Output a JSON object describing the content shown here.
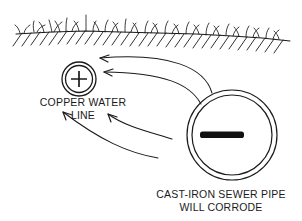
{
  "diagram": {
    "background_color": "#ffffff",
    "stroke_color": "#1a1a1a",
    "ground": {
      "name": "ground-line",
      "description": "soil surface line with grass tufts above and hatch marks below"
    },
    "copper_pipe": {
      "label_line1": "COPPER WATER",
      "label_line2": "LINE",
      "polarity_symbol": "+",
      "center_x": 79,
      "center_y": 79,
      "outer_radius": 17,
      "inner_radius": 14
    },
    "sewer_pipe": {
      "label_line1": "CAST-IRON SEWER PIPE",
      "label_line2": "WILL CORRODE",
      "polarity_symbol": "−",
      "center_x": 232,
      "center_y": 135,
      "outer_radius": 45,
      "inner_radius": 40
    },
    "current_arrows": [
      {
        "name": "arrow-upper-outer",
        "from": "sewer-pipe",
        "to": "copper-pipe"
      },
      {
        "name": "arrow-upper-inner",
        "from": "sewer-pipe",
        "to": "copper-pipe"
      },
      {
        "name": "arrow-lower-inner",
        "from": "sewer-pipe",
        "to": "copper-line-label"
      },
      {
        "name": "arrow-lower-outer",
        "from": "sewer-pipe",
        "to": "copper-line-label"
      }
    ]
  }
}
